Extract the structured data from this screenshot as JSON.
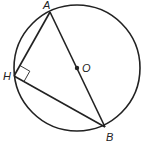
{
  "diagram": {
    "type": "geometry",
    "labels": {
      "A": "A",
      "B": "B",
      "H": "H",
      "O": "O"
    },
    "circle": {
      "cx": 77,
      "cy": 68,
      "r": 63
    },
    "points": {
      "A": [
        50,
        12
      ],
      "B": [
        105,
        127
      ],
      "H": [
        14,
        76
      ],
      "O": [
        77,
        68
      ]
    },
    "right_angle_at": "H",
    "stroke_color": "#222222"
  }
}
